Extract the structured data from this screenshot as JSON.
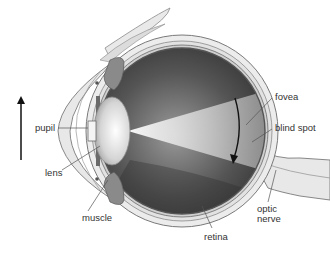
{
  "diagram": {
    "type": "anatomical-cross-section",
    "labels": {
      "pupil": "pupil",
      "lens": "lens",
      "muscle": "muscle",
      "fovea": "fovea",
      "blind_spot": "blind spot",
      "optic_nerve_line1": "optic",
      "optic_nerve_line2": "nerve",
      "retina": "retina"
    },
    "arrows": [
      {
        "name": "object-arrow",
        "direction": "up"
      },
      {
        "name": "retina-image-arrow",
        "direction": "down"
      }
    ],
    "colors": {
      "background": "#ffffff",
      "sclera": "#e6e6e6",
      "outline": "#7a7a7a",
      "interior_dark": "#3a3a3a",
      "muscle": "#8a8a8a",
      "light_cone": "#f2f2f2",
      "text": "#333333"
    }
  }
}
